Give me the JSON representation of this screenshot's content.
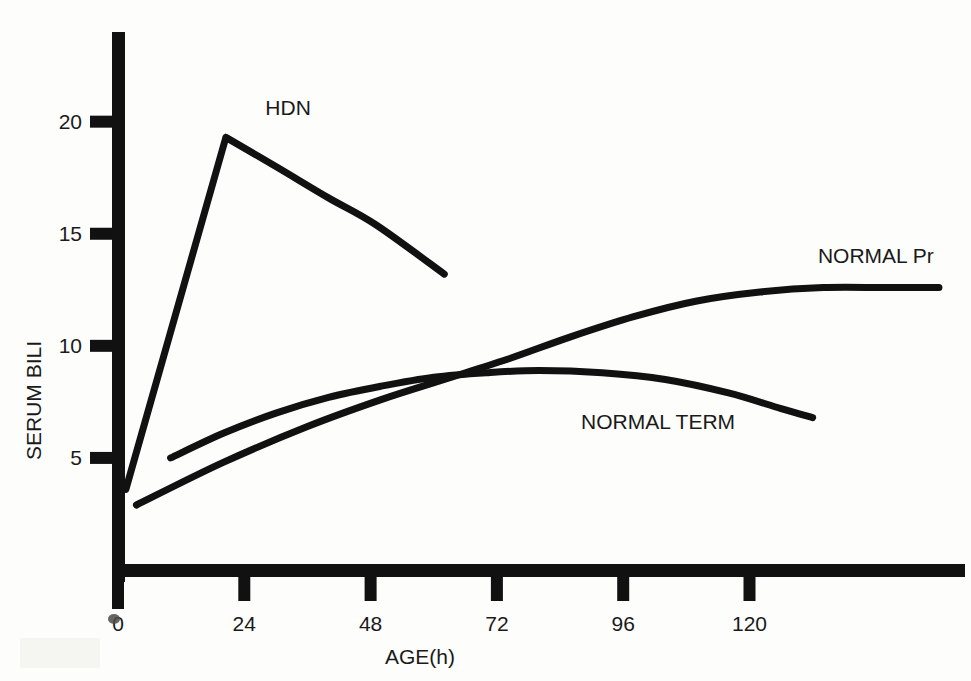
{
  "chart_data": {
    "type": "line",
    "title": "",
    "xlabel": "AGE(h)",
    "ylabel": "SERUM BILI",
    "xticks": [
      0,
      24,
      48,
      72,
      96,
      120
    ],
    "xtick_labels": [
      "0",
      "24",
      "48",
      "72",
      "96",
      "120"
    ],
    "yticks": [
      5,
      10,
      15,
      20
    ],
    "ytick_labels": [
      "5",
      "10",
      "15",
      "20"
    ],
    "xlim": [
      0,
      160
    ],
    "ylim": [
      0,
      24
    ],
    "grid": false,
    "legend_position": "inline-annotations",
    "series": [
      {
        "name": "HDN",
        "label": "HDN",
        "label_x": 28,
        "label_y": 20.6,
        "points": [
          [
            1.5,
            3.6
          ],
          [
            20.5,
            19.3
          ],
          [
            30.0,
            18.0
          ],
          [
            40.0,
            16.6
          ],
          [
            49.0,
            15.4
          ],
          [
            62.0,
            13.2
          ]
        ]
      },
      {
        "name": "NORMAL TERM",
        "label": "NORMAL TERM",
        "label_x": 88,
        "label_y": 6.6,
        "points": [
          [
            10.0,
            5.0
          ],
          [
            20.0,
            6.1
          ],
          [
            30.0,
            7.0
          ],
          [
            40.0,
            7.7
          ],
          [
            50.0,
            8.2
          ],
          [
            60.0,
            8.6
          ],
          [
            70.0,
            8.8
          ],
          [
            80.0,
            8.9
          ],
          [
            92.0,
            8.8
          ],
          [
            104.0,
            8.5
          ],
          [
            116.0,
            7.9
          ],
          [
            126.0,
            7.2
          ],
          [
            132.0,
            6.8
          ]
        ]
      },
      {
        "name": "NORMAL Pr",
        "label": "NORMAL Pr",
        "label_x": 133,
        "label_y": 14.0,
        "points": [
          [
            3.5,
            2.9
          ],
          [
            20.0,
            4.8
          ],
          [
            36.0,
            6.4
          ],
          [
            50.0,
            7.6
          ],
          [
            62.0,
            8.5
          ],
          [
            74.0,
            9.4
          ],
          [
            86.0,
            10.4
          ],
          [
            98.0,
            11.3
          ],
          [
            110.0,
            12.0
          ],
          [
            122.0,
            12.4
          ],
          [
            134.0,
            12.6
          ],
          [
            146.0,
            12.6
          ],
          [
            156.0,
            12.6
          ]
        ]
      }
    ]
  },
  "colors": {
    "ink": "#111111",
    "background": "#fdfdfc"
  },
  "axes": {
    "y_axis_name": "y-axis",
    "x_axis_name": "x-axis"
  }
}
